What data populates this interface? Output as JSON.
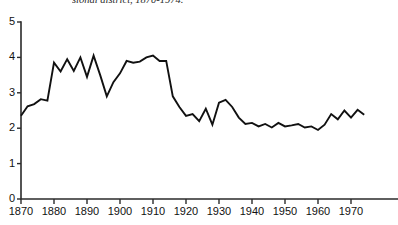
{
  "figure": {
    "caption": "sional district, 1870-1974.",
    "line_color": "#111111",
    "axis_color": "#2b2b2b",
    "background": "#ffffff"
  },
  "chart_data": {
    "type": "line",
    "title": "sional district, 1870-1974.",
    "xlabel": "",
    "ylabel": "",
    "xlim": [
      1870,
      1975
    ],
    "ylim": [
      0,
      5
    ],
    "grid": false,
    "legend": null,
    "y_ticks": [
      0,
      1,
      2,
      3,
      4,
      5
    ],
    "x_ticks": [
      1870,
      1880,
      1890,
      1900,
      1910,
      1920,
      1930,
      1940,
      1950,
      1960,
      1970
    ],
    "x_tick_labels": [
      "1870",
      "1880",
      "1890",
      "1900",
      "1910",
      "1920",
      "1930",
      "1940",
      "1950",
      "1960",
      "1970"
    ],
    "y_tick_labels": [
      "0",
      "1",
      "2",
      "3",
      "4",
      "5"
    ],
    "series": [
      {
        "name": "turnover",
        "x": [
          1870,
          1872,
          1874,
          1876,
          1878,
          1880,
          1882,
          1884,
          1886,
          1888,
          1890,
          1892,
          1894,
          1896,
          1898,
          1900,
          1902,
          1904,
          1906,
          1908,
          1910,
          1912,
          1914,
          1916,
          1918,
          1920,
          1922,
          1924,
          1926,
          1928,
          1930,
          1932,
          1934,
          1936,
          1938,
          1940,
          1942,
          1944,
          1946,
          1948,
          1950,
          1952,
          1954,
          1956,
          1958,
          1960,
          1962,
          1964,
          1966,
          1968,
          1970,
          1972,
          1974
        ],
        "values": [
          2.35,
          2.62,
          2.68,
          2.82,
          2.78,
          3.85,
          3.6,
          3.95,
          3.62,
          4.0,
          3.45,
          4.05,
          3.5,
          2.9,
          3.3,
          3.55,
          3.9,
          3.85,
          3.88,
          4.0,
          4.05,
          3.9,
          3.9,
          2.9,
          2.6,
          2.35,
          2.4,
          2.2,
          2.55,
          2.1,
          2.72,
          2.8,
          2.6,
          2.3,
          2.12,
          2.15,
          2.05,
          2.12,
          2.02,
          2.15,
          2.05,
          2.08,
          2.12,
          2.02,
          2.05,
          1.95,
          2.1,
          2.4,
          2.25,
          2.5,
          2.3,
          2.52,
          2.38
        ]
      }
    ]
  }
}
